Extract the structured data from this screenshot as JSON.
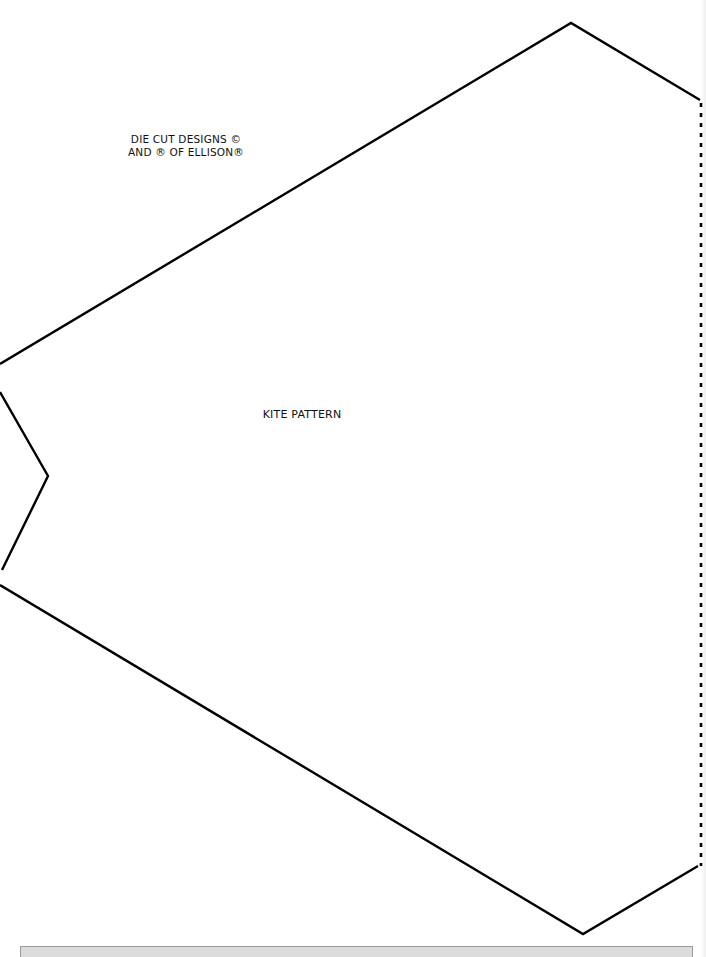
{
  "document": {
    "copyright_line1": "DIE CUT DESIGNS ©",
    "copyright_line2": "AND ® OF ELLISON®",
    "title": "KITE PATTERN"
  },
  "pattern": {
    "stroke_color": "#000000",
    "solid_outline_points": "0,364 571,23 700,100",
    "notch_points": "0,392 48,476 2,570",
    "lower_outline_points": "0,585 583,934 698,866",
    "fold_line": {
      "x": 701,
      "y1": 103,
      "y2": 866,
      "style": "dotted"
    }
  },
  "footer_bar_color": "#dcdcdc"
}
